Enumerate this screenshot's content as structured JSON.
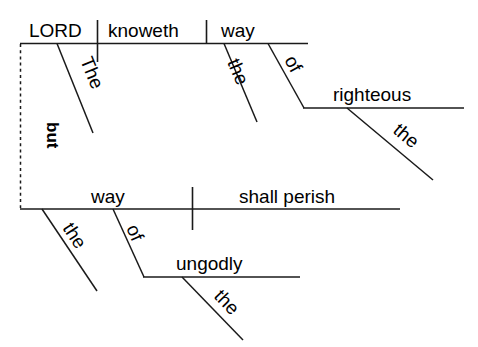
{
  "diagram": {
    "type": "reed-kellogg-sentence-diagram",
    "sentence": "The LORD knoweth the way of the righteous: but the way of the ungodly shall perish",
    "background_color": "#ffffff",
    "line_color": "#1a1a1a",
    "text_color": "#000000",
    "clause_connector": {
      "label": "but",
      "style": "dashed",
      "rotated": true
    },
    "clauses": [
      {
        "name": "main-clause-upper",
        "subject": "LORD",
        "verb": "knoweth",
        "direct_object": "way",
        "modifiers": [
          {
            "word": "The",
            "modifies": "LORD"
          },
          {
            "word": "the",
            "modifies": "way"
          }
        ],
        "prepositional_phrase": {
          "preposition": "of",
          "object": "righteous",
          "object_modifier": "the"
        }
      },
      {
        "name": "main-clause-lower",
        "subject": "way",
        "verb": "shall perish",
        "direct_object": null,
        "modifiers": [
          {
            "word": "the",
            "modifies": "way"
          }
        ],
        "prepositional_phrase": {
          "preposition": "of",
          "object": "ungodly",
          "object_modifier": "the"
        }
      }
    ],
    "words": {
      "lord": "LORD",
      "knoweth": "knoweth",
      "way_upper": "way",
      "the_lord": "The",
      "the_way_upper": "the",
      "of_upper": "of",
      "righteous": "righteous",
      "the_righteous": "the",
      "but": "but",
      "way_lower": "way",
      "the_way_lower": "the",
      "of_lower": "of",
      "ungodly": "ungodly",
      "the_ungodly": "the",
      "shall_perish": "shall perish"
    }
  }
}
